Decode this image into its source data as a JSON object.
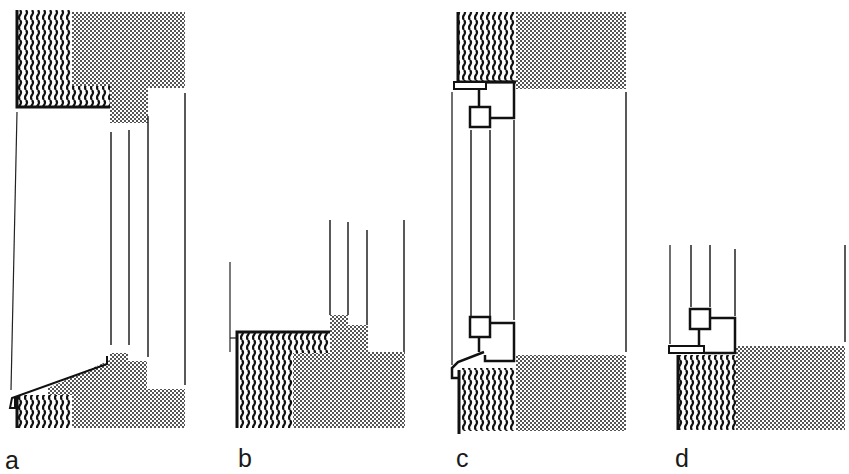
{
  "figure": {
    "colors": {
      "ink": "#1a1a1a",
      "stipple": "#7a7a7a",
      "background": "#ffffff"
    },
    "panels": [
      {
        "id": "a",
        "label": "a"
      },
      {
        "id": "b",
        "label": "b"
      },
      {
        "id": "c",
        "label": "c"
      },
      {
        "id": "d",
        "label": "d"
      }
    ]
  }
}
